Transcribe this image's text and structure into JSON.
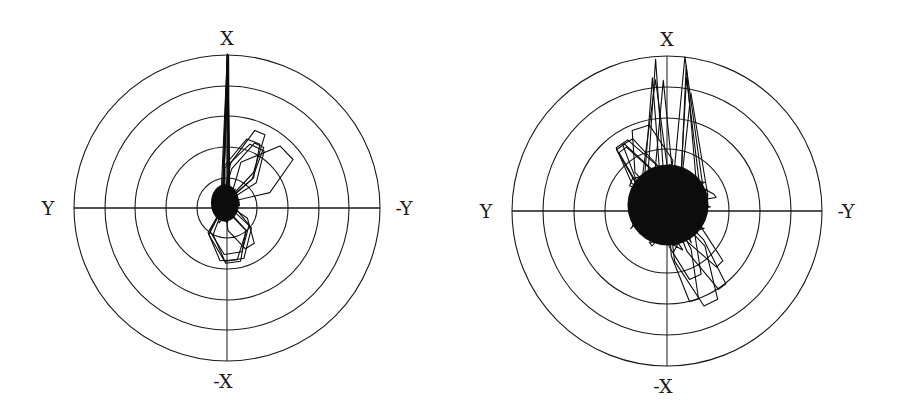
{
  "figure": {
    "background": "#ffffff",
    "ink_color": "#0d0d0d"
  },
  "chart_data": [
    {
      "type": "scatter",
      "subtype": "polar-trajectory",
      "title": "",
      "center_px": [
        227,
        208
      ],
      "ring_radii_px": [
        30,
        61,
        92,
        122,
        153
      ],
      "rings": 5,
      "labels": {
        "top": "X",
        "bottom": "-X",
        "left": "Y",
        "right": "-Y"
      },
      "grid": true,
      "description": "Dense trajectory cluster just above-left of center within the innermost ring, a narrow spike straight up along +X reaching the outer ring, and looped excursions toward upper-right (+X/-Y, into the third ring) and left (+Y, second ring).",
      "features": {
        "core": {
          "cx_px": 225,
          "cy_px": 203,
          "rx_px": 18,
          "ry_px": 24
        },
        "spike": {
          "direction": "+X",
          "reach_ring": 5
        },
        "lobes": [
          {
            "direction_deg": 35,
            "reach_ring": 3
          },
          {
            "direction_deg": 160,
            "reach_ring": 2
          }
        ]
      },
      "seed": 7,
      "steps": 900
    },
    {
      "type": "scatter",
      "subtype": "polar-trajectory",
      "title": "",
      "center_px": [
        667,
        211
      ],
      "ring_radii_px": [
        0,
        62,
        93,
        124,
        155
      ],
      "rings": 4,
      "labels": {
        "top": "X",
        "bottom": "-X",
        "left": "Y",
        "right": "-Y"
      },
      "grid": true,
      "description": "Large dense trajectory cloud centered near origin filling roughly the second ring, with several tall loops extending toward +X up to the outer ring and excursions toward upper-left (+Y) and lower-right.",
      "features": {
        "core": {
          "cx_px": 668,
          "cy_px": 205,
          "rx_px": 52,
          "ry_px": 52
        },
        "spikes": [
          {
            "direction": "+X",
            "reach_ring": 4
          },
          {
            "direction": "+X slightly -Y",
            "reach_ring": 4
          }
        ],
        "lobes": [
          {
            "direction_deg": 150,
            "reach_ring": 3
          },
          {
            "direction_deg": -30,
            "reach_ring": 3
          }
        ]
      },
      "seed": 19,
      "steps": 1600
    }
  ]
}
